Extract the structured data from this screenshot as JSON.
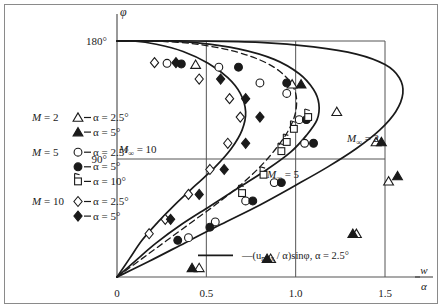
{
  "figure": {
    "kind": "scientific-plot",
    "background": "#ffffff",
    "ink": "#1a1a1a",
    "axis_color": "#555555"
  },
  "axes": {
    "y_axis_label": "φ",
    "y_ticks": [
      {
        "value": 180,
        "label": "180°"
      },
      {
        "value": 90,
        "label": "90°"
      }
    ],
    "y_range": [
      0,
      190
    ],
    "x_ticks": [
      {
        "value": 0.0,
        "label": "0"
      },
      {
        "value": 0.5,
        "label": "0.5"
      },
      {
        "value": 1.0,
        "label": "1.0"
      },
      {
        "value": 1.5,
        "label": "1.5"
      }
    ],
    "x_range": [
      0,
      1.72
    ],
    "x_axis_label_num": "w",
    "x_axis_label_den": "α",
    "gridlines": "vertical at 0.5, 1.0, 1.5 and horizontal at 90°"
  },
  "legend": {
    "groups": [
      {
        "mach_label_M": "M",
        "mach_label_eq": "= 2",
        "entries": [
          {
            "marker": "open-triangle",
            "alpha": "α = 2.5°"
          },
          {
            "marker": "filled-triangle",
            "alpha": "α = 5°"
          }
        ]
      },
      {
        "mach_label_M": "M",
        "mach_label_eq": "= 5",
        "entries": [
          {
            "marker": "open-circle",
            "alpha": "α = 2.5°"
          },
          {
            "marker": "filled-circle",
            "alpha": "α = 5°"
          },
          {
            "marker": "flagged-square",
            "alpha": "α = 10°"
          }
        ]
      },
      {
        "mach_label_M": "M",
        "mach_label_eq": "= 10",
        "entries": [
          {
            "marker": "open-diamond",
            "alpha": "α = 2.5°"
          },
          {
            "marker": "filled-diamond",
            "alpha": "α = 5°"
          }
        ]
      }
    ],
    "line_entry": {
      "marker": "solid-line",
      "text_lead": "—(u",
      "text_sub": "max",
      "text_mid": " / α)sinφ, α = 2.5°"
    }
  },
  "annotations": [
    {
      "name": "m-inf-10",
      "base": "M",
      "sub": "∞",
      "rest": "= 10",
      "x": 119,
      "y": 153
    },
    {
      "name": "m-inf-5",
      "base": "M",
      "sub": "∞",
      "rest": "= 5",
      "x": 267,
      "y": 178
    },
    {
      "name": "m-inf-2",
      "base": "M",
      "sub": "∞",
      "rest": "= 2",
      "x": 347,
      "y": 142
    }
  ],
  "chart_data": {
    "type": "line",
    "title": "",
    "xlabel": "w/α",
    "ylabel": "φ",
    "xlim": [
      0,
      1.72
    ],
    "ylim": [
      0,
      190
    ],
    "grid": true,
    "legend_position": "inside-left",
    "series": [
      {
        "name": "M∞ = 2 theoretical curve",
        "style": "solid",
        "points": [
          [
            0.0,
            0.0
          ],
          [
            0.18,
            12.0
          ],
          [
            0.38,
            26.0
          ],
          [
            0.58,
            40.0
          ],
          [
            0.8,
            55.0
          ],
          [
            1.0,
            70.0
          ],
          [
            1.18,
            84.0
          ],
          [
            1.34,
            98.0
          ],
          [
            1.47,
            112.0
          ],
          [
            1.56,
            126.0
          ],
          [
            1.6,
            140.0
          ],
          [
            1.58,
            152.0
          ],
          [
            1.5,
            162.0
          ],
          [
            1.34,
            170.0
          ],
          [
            1.1,
            175.5
          ],
          [
            0.8,
            179.0
          ],
          [
            0.45,
            180.0
          ],
          [
            0.15,
            180.0
          ],
          [
            0.0,
            180.0
          ]
        ]
      },
      {
        "name": "M∞ = 5 theoretical curve",
        "style": "solid",
        "points": [
          [
            0.0,
            0.0
          ],
          [
            0.1,
            12.0
          ],
          [
            0.22,
            26.0
          ],
          [
            0.36,
            40.0
          ],
          [
            0.52,
            54.0
          ],
          [
            0.68,
            68.0
          ],
          [
            0.84,
            82.0
          ],
          [
            0.97,
            95.0
          ],
          [
            1.06,
            108.0
          ],
          [
            1.12,
            120.0
          ],
          [
            1.13,
            132.0
          ],
          [
            1.1,
            143.0
          ],
          [
            1.02,
            155.0
          ],
          [
            0.88,
            166.0
          ],
          [
            0.68,
            174.0
          ],
          [
            0.45,
            178.5
          ],
          [
            0.22,
            180.0
          ],
          [
            0.0,
            180.0
          ]
        ]
      },
      {
        "name": "M∞ = 10 theoretical curve",
        "style": "solid",
        "points": [
          [
            0.0,
            0.0
          ],
          [
            0.07,
            14.0
          ],
          [
            0.14,
            28.0
          ],
          [
            0.23,
            42.0
          ],
          [
            0.33,
            56.0
          ],
          [
            0.44,
            70.0
          ],
          [
            0.55,
            84.0
          ],
          [
            0.64,
            98.0
          ],
          [
            0.7,
            112.0
          ],
          [
            0.72,
            126.0
          ],
          [
            0.69,
            140.0
          ],
          [
            0.62,
            152.0
          ],
          [
            0.51,
            163.0
          ],
          [
            0.37,
            172.0
          ],
          [
            0.22,
            177.5
          ],
          [
            0.09,
            180.0
          ],
          [
            0.0,
            180.0
          ]
        ]
      },
      {
        "name": "—(u_max/α)sinφ, α = 2.5°",
        "style": "dashed",
        "points": [
          [
            0.0,
            0.0
          ],
          [
            0.14,
            14.0
          ],
          [
            0.28,
            28.0
          ],
          [
            0.42,
            42.0
          ],
          [
            0.56,
            56.0
          ],
          [
            0.69,
            70.0
          ],
          [
            0.8,
            84.0
          ],
          [
            0.89,
            98.0
          ],
          [
            0.96,
            112.0
          ],
          [
            1.0,
            126.0
          ],
          [
            1.0,
            140.0
          ],
          [
            0.95,
            152.0
          ],
          [
            0.84,
            163.0
          ],
          [
            0.66,
            172.0
          ],
          [
            0.42,
            178.0
          ],
          [
            0.18,
            180.0
          ],
          [
            0.0,
            180.0
          ]
        ]
      }
    ],
    "scatter": [
      {
        "name": "M = 2, α = 2.5°",
        "marker": "open-triangle",
        "points": [
          [
            0.44,
            162.0
          ],
          [
            0.98,
            147.0
          ],
          [
            1.23,
            126.0
          ],
          [
            1.45,
            103.0
          ],
          [
            1.52,
            73.0
          ],
          [
            1.34,
            33.0
          ],
          [
            0.86,
            14.0
          ],
          [
            0.46,
            7.0
          ]
        ]
      },
      {
        "name": "M = 2, α = 5°",
        "marker": "filled-triangle",
        "points": [
          [
            1.03,
            147.0
          ],
          [
            1.48,
            103.0
          ],
          [
            1.57,
            77.0
          ],
          [
            1.32,
            33.0
          ],
          [
            0.84,
            14.0
          ],
          [
            0.42,
            7.0
          ]
        ]
      },
      {
        "name": "M = 5, α = 2.5°",
        "marker": "open-circle",
        "points": [
          [
            0.28,
            163.0
          ],
          [
            0.57,
            160.0
          ],
          [
            0.8,
            148.0
          ],
          [
            0.95,
            140.0
          ],
          [
            1.02,
            120.0
          ],
          [
            1.05,
            102.0
          ],
          [
            0.88,
            72.0
          ],
          [
            0.72,
            58.0
          ],
          [
            0.55,
            42.0
          ],
          [
            0.4,
            30.0
          ]
        ]
      },
      {
        "name": "M = 5, α = 5°",
        "marker": "filled-circle",
        "points": [
          [
            0.36,
            162.5
          ],
          [
            0.68,
            160.0
          ],
          [
            0.95,
            148.0
          ],
          [
            1.06,
            120.0
          ],
          [
            1.1,
            102.0
          ],
          [
            0.92,
            72.0
          ],
          [
            0.76,
            58.0
          ],
          [
            0.52,
            38.0
          ],
          [
            0.34,
            28.0
          ]
        ]
      },
      {
        "name": "M = 5, α = 10°",
        "marker": "flagged-square",
        "points": [
          [
            1.07,
            122.0
          ],
          [
            0.99,
            113.0
          ],
          [
            0.95,
            103.0
          ],
          [
            0.92,
            96.0
          ],
          [
            0.82,
            78.0
          ],
          [
            0.7,
            64.0
          ]
        ]
      },
      {
        "name": "M = 10, α = 2.5°",
        "marker": "open-diamond",
        "points": [
          [
            0.21,
            163.5
          ],
          [
            0.46,
            151.0
          ],
          [
            0.63,
            136.0
          ],
          [
            0.69,
            122.0
          ],
          [
            0.62,
            102.0
          ],
          [
            0.52,
            82.0
          ],
          [
            0.4,
            63.0
          ],
          [
            0.27,
            44.0
          ],
          [
            0.18,
            33.0
          ]
        ]
      },
      {
        "name": "M = 10, α = 5°",
        "marker": "filled-diamond",
        "points": [
          [
            0.33,
            163.5
          ],
          [
            0.58,
            151.0
          ],
          [
            0.72,
            136.0
          ],
          [
            0.8,
            122.0
          ],
          [
            0.72,
            102.0
          ],
          [
            0.6,
            82.0
          ],
          [
            0.46,
            63.0
          ],
          [
            0.3,
            44.0
          ]
        ]
      }
    ]
  }
}
